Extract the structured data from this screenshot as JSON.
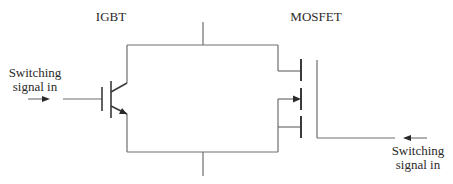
{
  "labels": {
    "igbt": "IGBT",
    "mosfet": "MOSFET",
    "signal_left_line1": "Switching",
    "signal_left_line2": "signal in",
    "signal_right_line1": "Switching",
    "signal_right_line2": "signal in"
  },
  "colors": {
    "line": "#6e6e6e",
    "device": "#3a3a3a",
    "text": "#2a2a2a",
    "background": "#ffffff"
  }
}
